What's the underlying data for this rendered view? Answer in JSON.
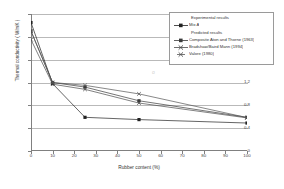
{
  "chart_data": {
    "type": "line",
    "title": "",
    "xlabel": "Rubber content (%)",
    "ylabel": "Thermal conductivity  ( W/mK )",
    "xlim": [
      0,
      100
    ],
    "ylim": [
      0,
      2.4
    ],
    "xticks": [
      0,
      10,
      20,
      30,
      40,
      50,
      60,
      70,
      80,
      90,
      100
    ],
    "yticks": [
      0,
      0.4,
      0.8,
      1.2,
      1.6,
      2,
      2.4
    ],
    "xtick_labels": [
      "0",
      "10",
      "20",
      "30",
      "40",
      "50",
      "60",
      "70",
      "80",
      "90",
      "100"
    ],
    "ytick_labels": [
      "0",
      "0.4",
      "0.8",
      "1.2",
      "1.6",
      "2",
      "2.4"
    ],
    "grid": "horizontal",
    "legend_position": "top-right",
    "series": [
      {
        "name": "Mix A",
        "group": "Experimental results",
        "marker": "square",
        "color": "#222222",
        "x": [
          0,
          10,
          25,
          50,
          100
        ],
        "values": [
          2.25,
          1.18,
          0.59,
          0.55,
          0.49
        ]
      },
      {
        "name": "Composite Aton and Thorne (1963)",
        "group": "Predicted results",
        "marker": "square",
        "color": "#3a3a3a",
        "x": [
          0,
          10,
          25,
          50,
          100
        ],
        "values": [
          2.1,
          1.2,
          1.12,
          0.88,
          0.59
        ]
      },
      {
        "name": "Bradshaw/Baird Mann (1994)",
        "group": "Predicted results",
        "marker": "cross",
        "color": "#4a4a4a",
        "x": [
          0,
          10,
          25,
          50,
          100
        ],
        "values": [
          1.95,
          1.17,
          1.08,
          0.84,
          0.58
        ]
      },
      {
        "name": "Valore (1980)",
        "group": "Predicted results",
        "marker": "cross",
        "color": "#555555",
        "x": [
          0,
          10,
          25,
          50,
          100
        ],
        "values": [
          2.1,
          1.2,
          1.15,
          1.0,
          0.585
        ]
      }
    ]
  },
  "legend": {
    "group_experimental": "Experimental results",
    "group_predicted": "Predicted results",
    "entries": [
      {
        "label": "Mix A"
      },
      {
        "label": "Composite Aton and Thorne (1963)"
      },
      {
        "label": "Bradshaw/Baird Mann (1994)"
      },
      {
        "label": "Valore (1980)"
      }
    ]
  },
  "artifact": "o"
}
